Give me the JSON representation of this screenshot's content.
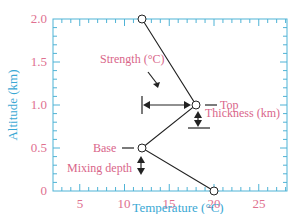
{
  "chart_data": {
    "type": "line",
    "title": "",
    "xlabel": "Temperature (°C)",
    "ylabel": "Altitude (km)",
    "xlim": [
      2,
      28
    ],
    "ylim": [
      0,
      2.0
    ],
    "x_ticks": [
      "5",
      "10",
      "15",
      "20",
      "25"
    ],
    "y_ticks": [
      "0",
      "0.5",
      "1.0",
      "1.5",
      "2.0"
    ],
    "grid": false,
    "series": [
      {
        "name": "temperature profile",
        "points": [
          {
            "x": 20,
            "y": 0
          },
          {
            "x": 12,
            "y": 0.5
          },
          {
            "x": 18,
            "y": 1.0
          },
          {
            "x": 12,
            "y": 2.0
          }
        ]
      }
    ],
    "annotations": {
      "strength": "Strength (°C)",
      "top": "Top",
      "thickness": "Thickness (km)",
      "base": "Base",
      "mixing_depth": "Mixing depth"
    }
  },
  "colors": {
    "axis": "#4fb3d6",
    "tick_label": "#e0708f",
    "axis_label": "#3aa8d4",
    "annotation": "#d9668a",
    "line": "#222222"
  }
}
